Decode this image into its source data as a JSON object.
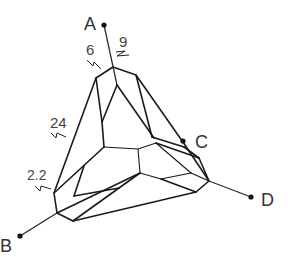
{
  "diagram": {
    "type": "crystal-habit-projection",
    "points": [
      {
        "id": "A",
        "label": "A"
      },
      {
        "id": "B",
        "label": "B"
      },
      {
        "id": "C",
        "label": "C"
      },
      {
        "id": "D",
        "label": "D"
      }
    ],
    "dimensions": [
      {
        "id": "d6",
        "value": "6"
      },
      {
        "id": "d9",
        "value": "9"
      },
      {
        "id": "d24",
        "value": "24"
      },
      {
        "id": "d22",
        "value": "2.2"
      }
    ],
    "colors": {
      "line": "#1a1a1a",
      "text": "#333333",
      "background": "#ffffff"
    }
  }
}
